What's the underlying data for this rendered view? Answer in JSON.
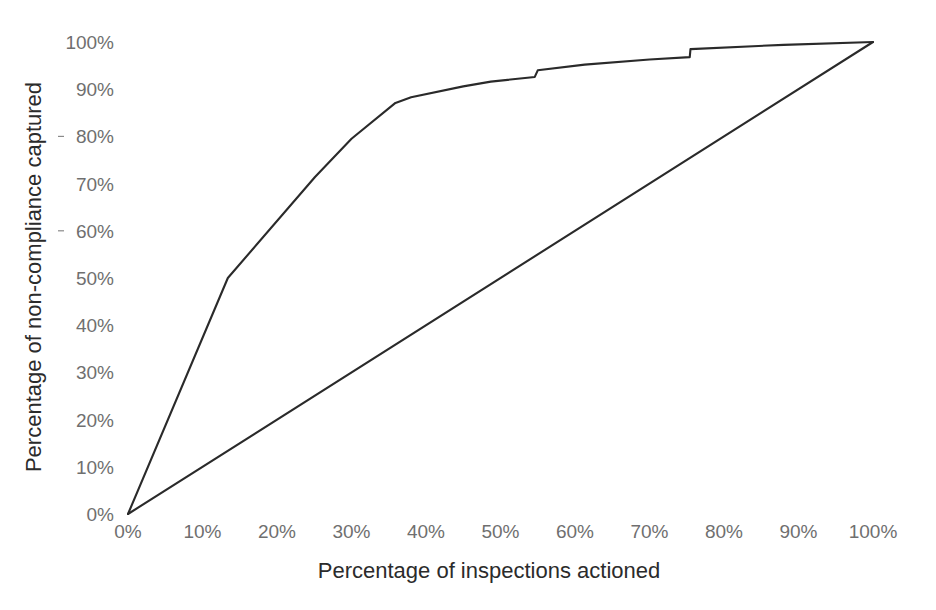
{
  "chart_data": {
    "type": "line",
    "title": "",
    "subtitle": "",
    "xlabel": "Percentage of inspections actioned",
    "ylabel": "Percentage of non-compliance captured",
    "xlim": [
      0,
      100
    ],
    "ylim": [
      0,
      100
    ],
    "grid": false,
    "legend": null,
    "x_tick_labels": [
      "0%",
      "10%",
      "20%",
      "30%",
      "40%",
      "50%",
      "60%",
      "70%",
      "80%",
      "90%",
      "100%"
    ],
    "x_tick_values": [
      0,
      10,
      20,
      30,
      40,
      50,
      60,
      70,
      80,
      90,
      100
    ],
    "y_tick_labels": [
      "0%",
      "10%",
      "20%",
      "30%",
      "40%",
      "50%",
      "60%",
      "70%",
      "80%",
      "90%",
      "100%"
    ],
    "y_tick_values": [
      0,
      10,
      20,
      30,
      40,
      50,
      60,
      70,
      80,
      90,
      100
    ],
    "line_color": "#2a2a2a",
    "tick_label_color": "#6f6f6f",
    "axis_title_color": "#2b2b2b",
    "series": [
      {
        "name": "Cumulative non-compliance captured",
        "points": [
          [
            0,
            0
          ],
          [
            13.4,
            50.0
          ],
          [
            25.1,
            71.4
          ],
          [
            30.0,
            79.5
          ],
          [
            35.9,
            87.1
          ],
          [
            38.0,
            88.3
          ],
          [
            45.0,
            90.6
          ],
          [
            48.7,
            91.6
          ],
          [
            54.6,
            92.6
          ],
          [
            55.0,
            94.0
          ],
          [
            61.3,
            95.2
          ],
          [
            70.0,
            96.3
          ],
          [
            75.4,
            96.8
          ],
          [
            75.5,
            98.5
          ],
          [
            88.0,
            99.4
          ],
          [
            100,
            100
          ]
        ]
      },
      {
        "name": "Random baseline",
        "points": [
          [
            0,
            0
          ],
          [
            100,
            100
          ]
        ]
      }
    ]
  }
}
